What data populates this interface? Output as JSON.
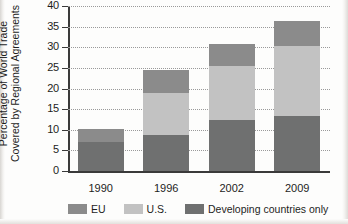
{
  "chart_data": {
    "type": "bar",
    "subtype": "stacked-bar",
    "title": "",
    "xlabel": "",
    "ylabel": "Percentage of World Trade Covered by Regional Agreements",
    "ylabel_lines": [
      "Percentage of World Trade",
      "Covered by Regional Agreements"
    ],
    "categories": [
      "1990",
      "1996",
      "2002",
      "2009"
    ],
    "ylim": [
      0,
      40
    ],
    "yticks": [
      0,
      5,
      10,
      15,
      20,
      25,
      30,
      35,
      40
    ],
    "ytick_labels": [
      "0",
      "5",
      "10",
      "15",
      "20",
      "25",
      "30",
      "35",
      "40"
    ],
    "grid": true,
    "grid_style": "dotted-horizontal",
    "legend_position": "bottom",
    "stack_order_bottom_to_top": [
      "Developing countries only",
      "U.S.",
      "EU"
    ],
    "series": [
      {
        "name": "Developing countries only",
        "color": "#6f7070",
        "values": [
          7.1,
          8.7,
          12.4,
          13.3
        ]
      },
      {
        "name": "U.S.",
        "color": "#c2c2c2",
        "values": [
          0.0,
          10.3,
          13.0,
          16.9
        ]
      },
      {
        "name": "EU",
        "color": "#8b8b8b",
        "values": [
          3.0,
          5.4,
          5.5,
          6.2
        ]
      }
    ],
    "stacked_totals": [
      10.1,
      24.4,
      30.9,
      36.4
    ],
    "annotations": []
  },
  "legend": {
    "items": [
      {
        "label": "EU",
        "color": "#8b8b8b"
      },
      {
        "label": "U.S.",
        "color": "#c2c2c2"
      },
      {
        "label": "Developing countries only",
        "color": "#6f7070"
      }
    ]
  }
}
